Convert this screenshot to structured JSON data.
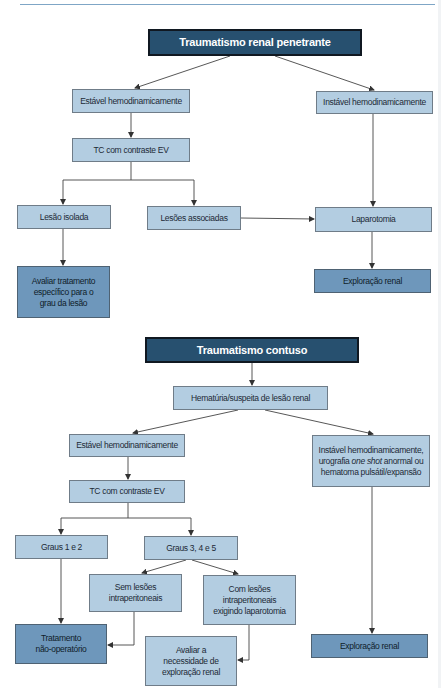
{
  "header": {
    "rule_color": "#7fa6c6"
  },
  "colors": {
    "title_fill": "#27506f",
    "light_fill": "#b3cde1",
    "mid_fill": "#6e97bb",
    "arrow": "#333333"
  },
  "penetrante": {
    "title": "Traumatismo renal penetrante",
    "estavel": "Estável hemodinamicamente",
    "instavel": "Instável hemodinamicamente",
    "tc": "TC com contraste EV",
    "lesao_isolada": "Lesão isolada",
    "lesoes_associadas": "Lesões associadas",
    "laparotomia": "Laparotomia",
    "avaliar": [
      "Avaliar tratamento",
      "específico para o",
      "grau da lesão"
    ],
    "exploracao": "Exploração renal"
  },
  "contuso": {
    "title": "Traumatismo contuso",
    "hematuria": "Hematúria/suspeita de lesão renal",
    "estavel": "Estável hemodinamicamente",
    "tc": "TC com contraste EV",
    "instavel": {
      "line1": "Instável hemodinamicamente,",
      "line2_pre": "urografia ",
      "line2_em": "one shot",
      "line2_post": " anormal ou",
      "line3": "hematoma pulsátil/expansão"
    },
    "graus_1_2": "Graus 1 e 2",
    "graus_3_4_5": "Graus 3, 4 e 5",
    "sem_lesoes": [
      "Sem lesões",
      "intraperitoneais"
    ],
    "com_lesoes": [
      "Com lesões",
      "intraperitoneais",
      "exigindo laparotomia"
    ],
    "tratamento": [
      "Tratamento",
      "não-operatório"
    ],
    "avaliar": [
      "Avaliar a",
      "necessidade de",
      "exploração renal"
    ],
    "exploracao": "Exploração renal"
  }
}
